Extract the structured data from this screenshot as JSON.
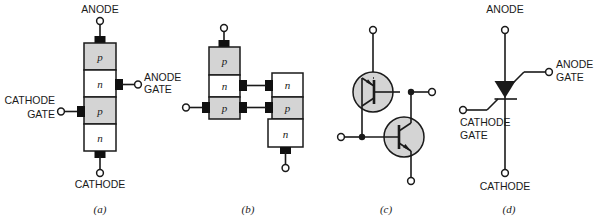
{
  "figure": {
    "colors": {
      "p_layer_fill": "#d4d4d4",
      "n_layer_fill": "#ffffff",
      "line": "#1a1a1a",
      "contact": "#101010",
      "transistor_fill": "#d4d4d4",
      "background": "#ffffff"
    },
    "panels": [
      {
        "id": "a",
        "caption": "(a)",
        "kind": "four-layer-structure",
        "terminals": [
          {
            "name": "anode",
            "label": "ANODE",
            "position": "top"
          },
          {
            "name": "anode-gate",
            "label": "ANODE\nGATE",
            "label_line1": "ANODE",
            "label_line2": "GATE",
            "position": "right"
          },
          {
            "name": "cathode-gate",
            "label": "CATHODE\nGATE",
            "label_line1": "CATHODE",
            "label_line2": "GATE",
            "position": "left"
          },
          {
            "name": "cathode",
            "label": "CATHODE",
            "position": "bottom"
          }
        ],
        "layers": [
          {
            "type": "p",
            "label": "p",
            "fill": "#d4d4d4"
          },
          {
            "type": "n",
            "label": "n",
            "fill": "#ffffff"
          },
          {
            "type": "p",
            "label": "p",
            "fill": "#d4d4d4"
          },
          {
            "type": "n",
            "label": "n",
            "fill": "#ffffff"
          }
        ]
      },
      {
        "id": "b",
        "caption": "(b)",
        "kind": "split-two-transistor-structure",
        "left_stack": [
          {
            "type": "p",
            "label": "p",
            "fill": "#d4d4d4"
          },
          {
            "type": "n",
            "label": "n",
            "fill": "#ffffff"
          },
          {
            "type": "p",
            "label": "p",
            "fill": "#d4d4d4"
          }
        ],
        "right_stack": [
          {
            "type": "n",
            "label": "n",
            "fill": "#ffffff"
          },
          {
            "type": "p",
            "label": "p",
            "fill": "#d4d4d4"
          },
          {
            "type": "n",
            "label": "n",
            "fill": "#ffffff"
          }
        ],
        "terminals": [
          {
            "name": "anode",
            "position": "top-left"
          },
          {
            "name": "cathode-gate",
            "position": "left"
          },
          {
            "name": "cathode",
            "position": "bottom-right"
          }
        ],
        "interconnects": [
          {
            "from": "left-n",
            "to": "right-n"
          },
          {
            "from": "left-p",
            "to": "right-p"
          }
        ]
      },
      {
        "id": "c",
        "caption": "(c)",
        "kind": "two-transistor-equivalent-circuit",
        "transistors": [
          {
            "name": "pnp-transistor",
            "type": "pnp",
            "position": "upper-left"
          },
          {
            "name": "npn-transistor",
            "type": "npn",
            "position": "lower-right"
          }
        ],
        "terminals": [
          {
            "name": "anode",
            "position": "top"
          },
          {
            "name": "anode-gate",
            "position": "right"
          },
          {
            "name": "cathode-gate",
            "position": "left"
          },
          {
            "name": "cathode",
            "position": "bottom"
          }
        ]
      },
      {
        "id": "d",
        "caption": "(d)",
        "kind": "schematic-symbol",
        "terminals": [
          {
            "name": "anode",
            "label": "ANODE",
            "position": "top"
          },
          {
            "name": "anode-gate",
            "label_line1": "ANODE",
            "label_line2": "GATE",
            "position": "upper-right"
          },
          {
            "name": "cathode-gate",
            "label_line1": "CATHODE",
            "label_line2": "GATE",
            "position": "left"
          },
          {
            "name": "cathode",
            "label": "CATHODE",
            "position": "bottom"
          }
        ]
      }
    ]
  }
}
